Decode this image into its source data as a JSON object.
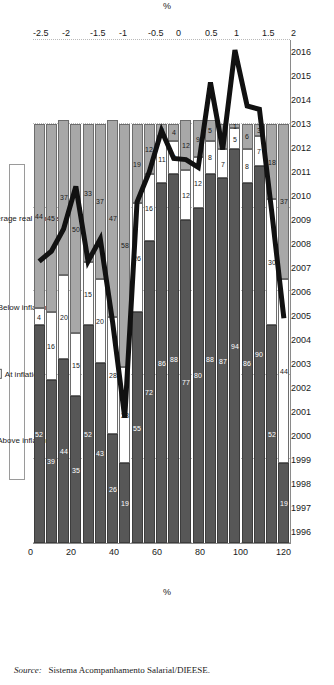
{
  "figure": {
    "source_label": "Source:",
    "source_text": "Sistema Acompanhamento Salarial/DIEESE."
  },
  "legend": {
    "position": "bottom-center",
    "items": [
      {
        "key": "above",
        "label": "Above inflation",
        "color": "#575757",
        "marker": "square"
      },
      {
        "key": "at",
        "label": "At inflation",
        "color": "#ffffff",
        "marker": "square"
      },
      {
        "key": "below",
        "label": "Below inflation",
        "color": "#a8a8a8",
        "marker": "square"
      },
      {
        "key": "line",
        "label": "Average real increase",
        "color": "#111111",
        "marker": "line"
      }
    ]
  },
  "axes": {
    "primary": {
      "title": "%",
      "ticks": [
        "0",
        "20",
        "40",
        "60",
        "80",
        "100",
        "120"
      ],
      "min": 0,
      "max": 120
    },
    "secondary": {
      "title": "%",
      "ticks": [
        "2",
        "1.5",
        "1",
        "0.5",
        "0",
        "-0.5",
        "-1",
        "-1.5",
        "-2",
        "-2.5"
      ],
      "min": -2.5,
      "max": 2
    }
  },
  "chart_data": {
    "type": "bar",
    "title": "",
    "subtitle": "",
    "xlabel": "",
    "ylabel": "%",
    "ylim": [
      0,
      120
    ],
    "y2lim": [
      -2.5,
      2
    ],
    "y2label": "%",
    "grid": true,
    "orientation": "vertical-stacked",
    "legend_position": "bottom-center",
    "categories": [
      "1996",
      "1997",
      "1998",
      "1999",
      "2000",
      "2001",
      "2002",
      "2003",
      "2004",
      "2005",
      "2006",
      "2007",
      "2008",
      "2009",
      "2010",
      "2011",
      "2012",
      "2013",
      "2014",
      "2015",
      "2016"
    ],
    "series": [
      {
        "name": "Above inflation",
        "color": "#575757",
        "values": [
          52,
          39,
          44,
          35,
          52,
          43,
          26,
          19,
          55,
          72,
          86,
          88,
          77,
          80,
          88,
          87,
          94,
          86,
          90,
          52,
          19
        ]
      },
      {
        "name": "At inflation",
        "color": "#ffffff",
        "values": [
          4,
          16,
          20,
          15,
          15,
          20,
          28,
          23,
          26,
          16,
          11,
          8,
          12,
          12,
          8,
          7,
          5,
          8,
          7,
          30,
          44
        ]
      },
      {
        "name": "Below inflation",
        "color": "#a8a8a8",
        "values": [
          44,
          45,
          37,
          50,
          33,
          37,
          47,
          58,
          19,
          12,
          3,
          4,
          12,
          9,
          5,
          6,
          1,
          6,
          3,
          18,
          37
        ]
      }
    ],
    "line_series": {
      "name": "Average real increase",
      "color": "#111111",
      "axis": "secondary",
      "values": [
        0.02,
        0.11,
        0.31,
        0.69,
        0.02,
        0.22,
        -0.52,
        -1.38,
        0.55,
        0.82,
        1.19,
        0.94,
        0.93,
        0.86,
        1.62,
        1.02,
        1.91,
        1.41,
        1.38,
        0.47,
        -0.49
      ]
    }
  }
}
